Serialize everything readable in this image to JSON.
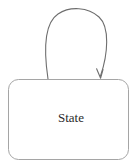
{
  "diagram": {
    "type": "state-machine",
    "background_color": "#ffffff",
    "stroke_color": "#6e6e6e",
    "text_color": "#2b2b2b",
    "nodes": [
      {
        "id": "state-1",
        "label": "State",
        "shape": "rounded-rectangle",
        "corner_radius": 10,
        "x": 8,
        "y": 79,
        "width": 121,
        "height": 81,
        "fill": "#ffffff",
        "stroke": "#9a9a9a",
        "stroke_width": 1
      }
    ],
    "edges": [
      {
        "id": "self-loop-1",
        "from": "state-1",
        "to": "state-1",
        "kind": "self-transition",
        "label": "",
        "stroke": "#6e6e6e",
        "stroke_width": 1,
        "arrowhead": "open-barb",
        "arrowhead_at": "target",
        "start_point": [
          48,
          79
        ],
        "end_point": [
          100,
          78
        ],
        "apex_y": 11
      }
    ]
  }
}
